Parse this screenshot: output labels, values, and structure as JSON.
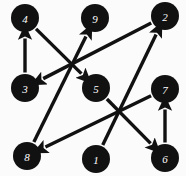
{
  "diagram": {
    "width": 186,
    "height": 176,
    "background_color": "#fbfbfb",
    "node_color": "#111111",
    "node_label_color": "#ffffff",
    "edge_color": "#111111",
    "node_radius": 14,
    "nodes": [
      {
        "id": "4",
        "label": "4",
        "x": 25,
        "y": 18
      },
      {
        "id": "9",
        "label": "9",
        "x": 95,
        "y": 18
      },
      {
        "id": "2",
        "label": "2",
        "x": 165,
        "y": 16
      },
      {
        "id": "3",
        "label": "3",
        "x": 25,
        "y": 88
      },
      {
        "id": "5",
        "label": "5",
        "x": 96,
        "y": 88
      },
      {
        "id": "7",
        "label": "7",
        "x": 165,
        "y": 89
      },
      {
        "id": "8",
        "label": "8",
        "x": 27,
        "y": 156
      },
      {
        "id": "1",
        "label": "1",
        "x": 96,
        "y": 159
      },
      {
        "id": "6",
        "label": "6",
        "x": 165,
        "y": 158
      }
    ],
    "edges": [
      {
        "from": "3",
        "to": "4",
        "directed": true
      },
      {
        "from": "4",
        "to": "5",
        "directed": true
      },
      {
        "from": "8",
        "to": "9",
        "directed": true
      },
      {
        "from": "2",
        "to": "3",
        "directed": true
      },
      {
        "from": "1",
        "to": "2",
        "directed": true
      },
      {
        "from": "5",
        "to": "6",
        "directed": true
      },
      {
        "from": "7",
        "to": "8",
        "directed": true
      },
      {
        "from": "6",
        "to": "7",
        "directed": true
      }
    ]
  }
}
